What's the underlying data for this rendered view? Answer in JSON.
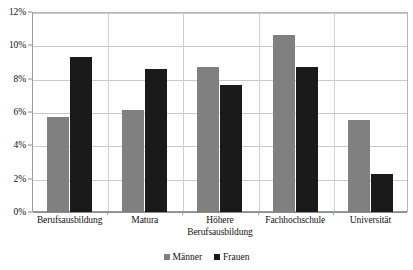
{
  "chart_data": {
    "type": "bar",
    "title": "",
    "subtitle": "",
    "xlabel": "",
    "ylabel": "",
    "categories": [
      "Berufsausbildung",
      "Matura",
      "Höhere Berufsausbildung",
      "Fachhochschule",
      "Universität"
    ],
    "series": [
      {
        "name": "Männer",
        "color": "#808080",
        "values": [
          5.7,
          6.1,
          8.7,
          10.6,
          5.5
        ]
      },
      {
        "name": "Frauen",
        "color": "#1a1a1a",
        "values": [
          9.3,
          8.6,
          7.6,
          8.7,
          2.3
        ]
      }
    ],
    "ylim": [
      0,
      12
    ],
    "yticks": [
      0,
      2,
      4,
      6,
      8,
      10,
      12
    ],
    "ytick_labels": [
      "0%",
      "2%",
      "4%",
      "6%",
      "8%",
      "10%",
      "12%"
    ],
    "grid": true,
    "grid_axis": "y",
    "legend_position": "bottom",
    "value_format": "percent"
  },
  "legend": {
    "entries": [
      {
        "label": "Männer"
      },
      {
        "label": "Frauen"
      }
    ]
  }
}
